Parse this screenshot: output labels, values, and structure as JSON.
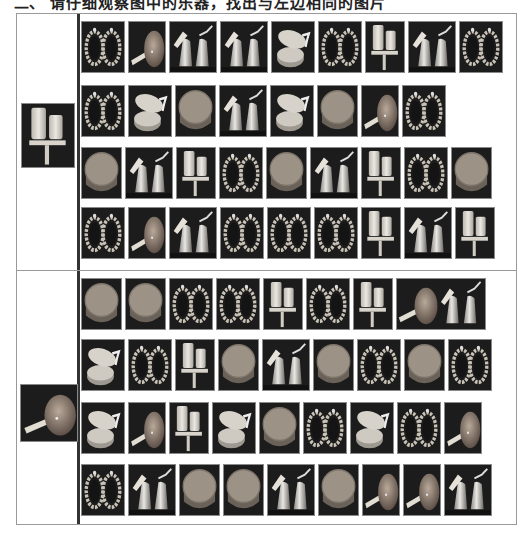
{
  "caption": {
    "number": "二、",
    "text": "请仔细观察图中的乐器，找出与左边相同的图片"
  },
  "colors": {
    "tile_bg": "#1c1c1c",
    "object_light": "#d8d4cc",
    "object_mid": "#a39d93",
    "drum_top": "#9c9285",
    "border": "#8a8a8a",
    "divider": "#333333"
  },
  "sections": [
    {
      "reference": {
        "item": "stand",
        "label": "two-cylinder stand"
      },
      "rows": [
        [
          "frame",
          "maraca",
          "bells",
          "bells",
          "castanet",
          "frame",
          "stand",
          "bells",
          "frame"
        ],
        [
          "frame",
          "castanet",
          "drum",
          "bells",
          "castanet",
          "drum",
          "maraca",
          "frame"
        ],
        [
          "drum",
          "bells",
          "stand",
          "frame",
          "drum",
          "bells",
          "stand",
          "frame",
          "drum"
        ],
        [
          "frame",
          "maraca",
          "bells",
          "frame",
          "frame",
          "frame",
          "stand",
          "bells",
          "stand"
        ]
      ]
    },
    {
      "reference": {
        "item": "maraca",
        "label": "round maraca"
      },
      "rows": [
        [
          "drum",
          "drum",
          "frame",
          "frame",
          "stand",
          "frame",
          "stand",
          "maraca+bells"
        ],
        [
          "castanet",
          "frame",
          "stand",
          "drum",
          "bells",
          "drum",
          "frame",
          "drum",
          "frame"
        ],
        [
          "castanet",
          "maraca",
          "stand",
          "castanet",
          "drum",
          "frame",
          "castanet",
          "frame",
          "maraca"
        ],
        [
          "frame",
          "bells",
          "drum",
          "drum",
          "bells",
          "drum",
          "maraca",
          "maraca",
          "bells"
        ]
      ]
    }
  ]
}
